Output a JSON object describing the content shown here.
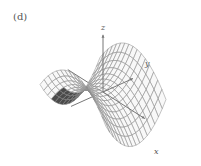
{
  "figure": {
    "panel_label": "(d)",
    "surface": "saddle",
    "axes": {
      "x_label": "x",
      "y_label": "y",
      "z_label": "z"
    },
    "colors": {
      "mesh_line": "#8a8a8a",
      "mesh_fill_light": "#f2f2f2",
      "mesh_fill_dark": "#2a2a2a",
      "axis": "#777777"
    }
  }
}
